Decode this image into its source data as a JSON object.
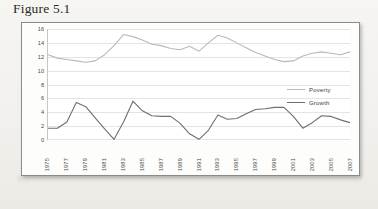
{
  "figure": {
    "caption": "Figure 5.1"
  },
  "legend": {
    "position": "right",
    "items": [
      {
        "label": "Poverty",
        "color": "#b9b9b9",
        "icon": "line-swatch-icon"
      },
      {
        "label": "Growth",
        "color": "#6e6e6e",
        "icon": "line-swatch-icon"
      }
    ]
  },
  "chart_data": {
    "type": "line",
    "title": "",
    "xlabel": "",
    "ylabel": "",
    "ylim": [
      0,
      16
    ],
    "yticks": [
      0,
      2,
      4,
      6,
      8,
      10,
      12,
      14,
      16
    ],
    "grid": true,
    "x": [
      1975,
      1976,
      1977,
      1978,
      1979,
      1980,
      1981,
      1982,
      1983,
      1984,
      1985,
      1986,
      1987,
      1988,
      1989,
      1990,
      1991,
      1992,
      1993,
      1994,
      1995,
      1996,
      1997,
      1998,
      1999,
      2000,
      2001,
      2002,
      2003,
      2004,
      2005,
      2006,
      2007
    ],
    "xtick_labels": [
      "1975",
      "1977",
      "1979",
      "1981",
      "1983",
      "1985",
      "1987",
      "1989",
      "1991",
      "1993",
      "1995",
      "1997",
      "1999",
      "2001",
      "2003",
      "2005",
      "2007"
    ],
    "xtick_values": [
      1975,
      1977,
      1979,
      1981,
      1983,
      1985,
      1987,
      1989,
      1991,
      1993,
      1995,
      1997,
      1999,
      2001,
      2003,
      2005,
      2007
    ],
    "series": [
      {
        "name": "Poverty",
        "color": "#b9b9b9",
        "values": [
          12.3,
          11.8,
          11.6,
          11.4,
          11.2,
          11.4,
          12.3,
          13.6,
          15.2,
          14.9,
          14.4,
          13.8,
          13.6,
          13.2,
          13.0,
          13.5,
          12.8,
          14.0,
          15.1,
          14.7,
          14.0,
          13.3,
          12.6,
          12.1,
          11.6,
          11.3,
          11.4,
          12.1,
          12.5,
          12.7,
          12.5,
          12.3,
          12.7
        ]
      },
      {
        "name": "Growth",
        "color": "#6e6e6e",
        "values": [
          1.7,
          1.7,
          2.6,
          5.4,
          4.8,
          3.2,
          1.6,
          0.1,
          2.6,
          5.6,
          4.2,
          3.5,
          3.4,
          3.4,
          2.4,
          0.9,
          0.1,
          1.4,
          3.6,
          3.0,
          3.1,
          3.8,
          4.4,
          4.5,
          4.7,
          4.7,
          3.4,
          1.7,
          2.5,
          3.5,
          3.4,
          2.9,
          2.5
        ]
      }
    ]
  }
}
